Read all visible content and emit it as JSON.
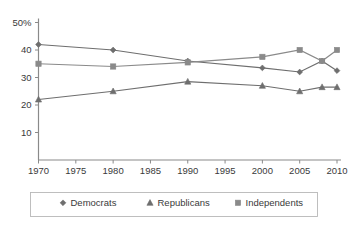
{
  "chart_data": {
    "type": "line",
    "title": "",
    "subtitle": "",
    "xlabel": "",
    "ylabel": "",
    "xlim": [
      1970,
      2010
    ],
    "ylim": [
      0,
      50
    ],
    "grid": false,
    "legend_position": "bottom",
    "x_ticks": [
      "1970",
      "1975",
      "1980",
      "1985",
      "1990",
      "1995",
      "2000",
      "2005",
      "2010"
    ],
    "x_tick_values": [
      1970,
      1975,
      1980,
      1985,
      1990,
      1995,
      2000,
      2005,
      2010
    ],
    "y_ticks": [
      "50%",
      "40",
      "30",
      "20",
      "10"
    ],
    "y_tick_values": [
      50,
      40,
      30,
      20,
      10
    ],
    "series": [
      {
        "name": "Democrats",
        "color": "#6e6e6e",
        "marker": "diamond",
        "x": [
          1970,
          1980,
          1990,
          2000,
          2005,
          2008,
          2010
        ],
        "values": [
          42,
          40,
          36,
          33.5,
          32,
          36,
          32.5
        ]
      },
      {
        "name": "Republicans",
        "color": "#6e6e6e",
        "marker": "triangle",
        "x": [
          1970,
          1980,
          1990,
          2000,
          2005,
          2008,
          2010
        ],
        "values": [
          22,
          25,
          28.5,
          27,
          25,
          26.5,
          26.5
        ]
      },
      {
        "name": "Independents",
        "color": "#8a8a8a",
        "marker": "square",
        "x": [
          1970,
          1980,
          1990,
          2000,
          2005,
          2008,
          2010
        ],
        "values": [
          35,
          34,
          35.5,
          37.5,
          40,
          36,
          40
        ]
      }
    ]
  },
  "legend": {
    "items": [
      {
        "label": "Democrats",
        "marker": "diamond",
        "color": "#6e6e6e"
      },
      {
        "label": "Republicans",
        "marker": "triangle",
        "color": "#6e6e6e"
      },
      {
        "label": "Independents",
        "marker": "square",
        "color": "#8a8a8a"
      }
    ]
  }
}
